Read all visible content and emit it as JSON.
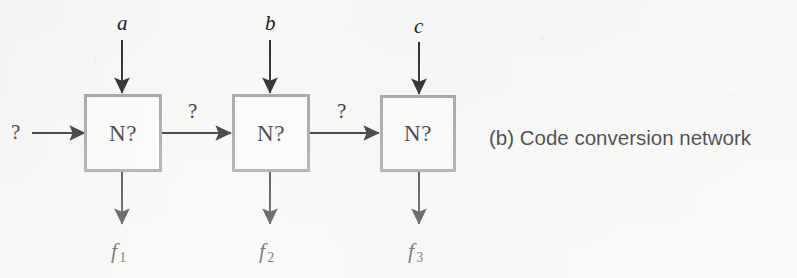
{
  "figure": {
    "caption": "(b) Code conversion network",
    "background_color": "#f7f7f5",
    "box_border_color": "#9a9a99",
    "ink_color": "#111217"
  },
  "nodes": [
    {
      "id": "n1",
      "label": "N?"
    },
    {
      "id": "n2",
      "label": "N?"
    },
    {
      "id": "n3",
      "label": "N?"
    }
  ],
  "inputs": {
    "top": [
      {
        "label": "a",
        "target": "n1"
      },
      {
        "label": "b",
        "target": "n2"
      },
      {
        "label": "c",
        "target": "n3"
      }
    ],
    "left": {
      "label": "?",
      "target": "n1"
    }
  },
  "interconnects": [
    {
      "label": "?",
      "from": "n1",
      "to": "n2"
    },
    {
      "label": "?",
      "from": "n2",
      "to": "n3"
    }
  ],
  "outputs": [
    {
      "base": "f",
      "sub": "1",
      "source": "n1"
    },
    {
      "base": "f",
      "sub": "2",
      "source": "n2"
    },
    {
      "base": "f",
      "sub": "3",
      "source": "n3"
    }
  ]
}
